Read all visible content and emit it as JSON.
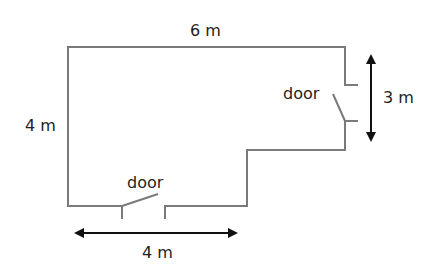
{
  "diagram": {
    "type": "floor-plan",
    "labels": {
      "top_width": "6 m",
      "left_height": "4 m",
      "right_height": "3 m",
      "bottom_width": "4 m",
      "right_door": "door",
      "bottom_door": "door"
    },
    "colors": {
      "wall": "#7a7a7a",
      "arrow": "#111111",
      "text": "#222222"
    }
  }
}
